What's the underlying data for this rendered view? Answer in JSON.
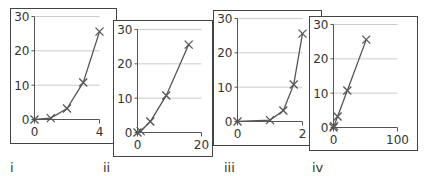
{
  "chart_data": [
    {
      "type": "line",
      "panel_label": "i",
      "x": [
        0,
        1,
        2,
        3,
        4
      ],
      "y": [
        0,
        0.4,
        3.2,
        10.8,
        25.6
      ],
      "xlim": [
        0,
        4
      ],
      "ylim": [
        0,
        30
      ],
      "xticks": [
        "0",
        "4"
      ],
      "yticks": [
        "0",
        "10",
        "20",
        "30"
      ],
      "grid": "horizontal",
      "marker": "x"
    },
    {
      "type": "line",
      "panel_label": "ii",
      "x": [
        0,
        1,
        4,
        9,
        16
      ],
      "y": [
        0,
        0.4,
        3.2,
        10.8,
        25.6
      ],
      "xlim": [
        0,
        20
      ],
      "ylim": [
        0,
        30
      ],
      "xticks": [
        "0",
        "20"
      ],
      "yticks": [
        "0",
        "10",
        "20",
        "30"
      ],
      "grid": "horizontal",
      "marker": "x"
    },
    {
      "type": "line",
      "panel_label": "iii",
      "x": [
        0,
        1,
        1.41,
        1.73,
        2
      ],
      "y": [
        0,
        0.4,
        3.2,
        10.8,
        25.6
      ],
      "xlim": [
        0,
        2
      ],
      "ylim": [
        0,
        30
      ],
      "xticks": [
        "0",
        "2"
      ],
      "yticks": [
        "0",
        "10",
        "20",
        "30"
      ],
      "grid": "horizontal",
      "marker": "x"
    },
    {
      "type": "line",
      "panel_label": "iv",
      "x": [
        0,
        0.8,
        6.4,
        21.6,
        51.2
      ],
      "y": [
        0,
        0.4,
        3.2,
        10.8,
        25.6
      ],
      "xlim": [
        0,
        100
      ],
      "ylim": [
        0,
        30
      ],
      "xticks": [
        "0",
        "100"
      ],
      "yticks": [
        "0",
        "10",
        "20",
        "30"
      ],
      "grid": "horizontal",
      "marker": "x"
    }
  ],
  "colors": {
    "line": "#555555",
    "grid": "#cccccc",
    "axis": "#555555",
    "frame": "#444444"
  }
}
